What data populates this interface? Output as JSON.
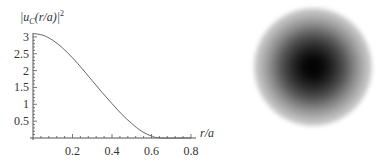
{
  "chart_data": {
    "type": "line",
    "title": "",
    "ylabel": "|u_C(r/a)|²",
    "xlabel": "r/a",
    "xlim": [
      0,
      0.82
    ],
    "ylim": [
      0,
      3.2
    ],
    "x_ticks": [
      "0.2",
      "0.4",
      "0.6",
      "0.8"
    ],
    "y_ticks": [
      "0.5",
      "1",
      "1.5",
      "2",
      "2.5",
      "3"
    ],
    "grid": false,
    "legend": null,
    "series": [
      {
        "name": "|u_C(r/a)|^2",
        "x": [
          0,
          0.05,
          0.1,
          0.15,
          0.2,
          0.25,
          0.3,
          0.35,
          0.4,
          0.45,
          0.5,
          0.55,
          0.6,
          0.65,
          0.8
        ],
        "values": [
          3.1,
          3.05,
          2.9,
          2.67,
          2.38,
          2.05,
          1.7,
          1.35,
          1.02,
          0.7,
          0.43,
          0.2,
          0.06,
          0.0,
          0.0
        ]
      }
    ],
    "side_image": "radially symmetric blurred dark disk (density map)"
  },
  "labels": {
    "ylabel_main": "|u",
    "ylabel_sub": "C",
    "ylabel_rest": "(r/a)|",
    "ylabel_sup": "2",
    "xlabel": "r/a"
  }
}
